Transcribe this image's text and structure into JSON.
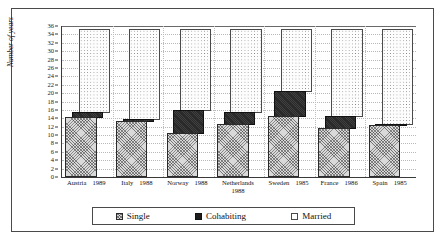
{
  "chart_data": {
    "type": "bar",
    "title": "",
    "subtitle": "",
    "xlabel": "",
    "ylabel": "Number of years",
    "ylim": [
      0,
      36
    ],
    "ytick_step": 2,
    "yticks": [
      0,
      2,
      4,
      6,
      8,
      10,
      12,
      14,
      16,
      18,
      20,
      22,
      24,
      26,
      28,
      30,
      32,
      34,
      36
    ],
    "grid": true,
    "stacked": true,
    "legend_position": "bottom",
    "categories": [
      "Austria 1989",
      "Italy 1988",
      "Norway 1988",
      "Netherlands 1988",
      "Sweden 1985",
      "France 1986",
      "Spain 1985"
    ],
    "category_parts": [
      {
        "country": "Austria",
        "year": "1989",
        "wrap": false
      },
      {
        "country": "Italy",
        "year": "1988",
        "wrap": false
      },
      {
        "country": "Norway",
        "year": "1988",
        "wrap": false
      },
      {
        "country": "Netherlands",
        "year": "1988",
        "wrap": true
      },
      {
        "country": "Sweden",
        "year": "1985",
        "wrap": false
      },
      {
        "country": "France",
        "year": "1986",
        "wrap": false
      },
      {
        "country": "Spain",
        "year": "1985",
        "wrap": false
      }
    ],
    "series": [
      {
        "name": "Single",
        "pattern": "hatched",
        "color": "#d9d9d9",
        "values": [
          14.0,
          13.0,
          10.3,
          12.5,
          14.3,
          11.5,
          12.2
        ]
      },
      {
        "name": "Cohabiting",
        "pattern": "solid",
        "color": "#1e1e1e",
        "values": [
          1.3,
          0.5,
          5.5,
          2.7,
          6.0,
          2.7,
          0.3
        ]
      },
      {
        "name": "Married",
        "pattern": "dotted",
        "color": "#ffffff",
        "values": [
          19.7,
          21.5,
          19.2,
          19.8,
          14.7,
          20.8,
          22.5
        ]
      }
    ],
    "cumulative_tops": {
      "single": [
        14.0,
        13.0,
        10.3,
        12.5,
        14.3,
        11.5,
        12.2
      ],
      "cohabiting": [
        15.3,
        13.5,
        15.8,
        15.2,
        20.3,
        14.2,
        12.5
      ],
      "married": [
        35.0,
        35.0,
        35.0,
        35.0,
        35.0,
        35.0,
        35.0
      ]
    }
  },
  "legend": {
    "items": [
      {
        "label": "Single"
      },
      {
        "label": "Cohabiting"
      },
      {
        "label": "Married"
      }
    ]
  }
}
